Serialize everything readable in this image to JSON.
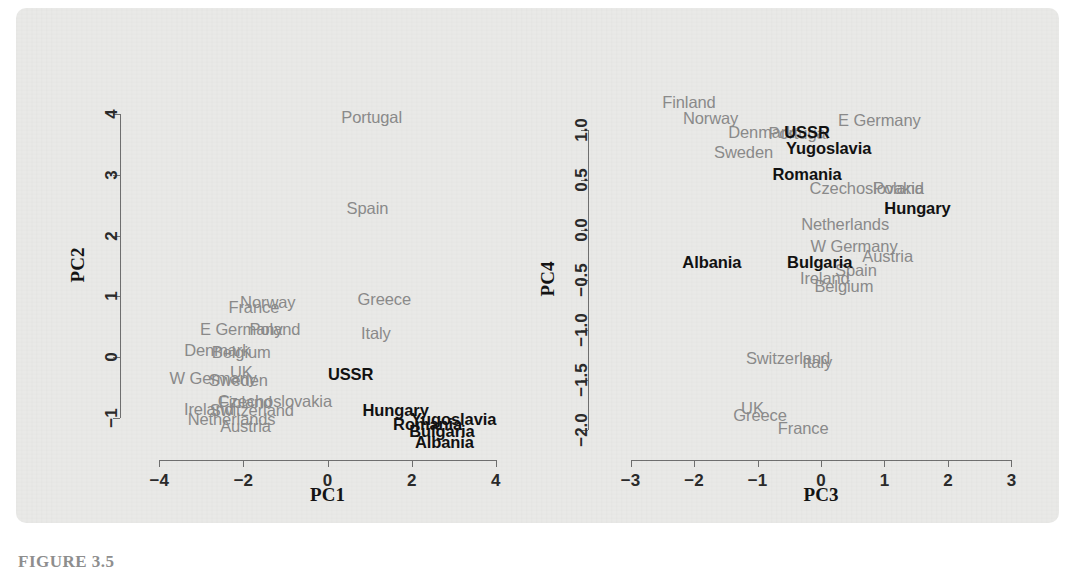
{
  "caption": "FIGURE 3.5",
  "colors": {
    "panel_background": "#e9e9e7",
    "page_background": "#ffffff",
    "axis": "#6f6f6f",
    "western_label": "#8b8b8b",
    "eastern_label": "#121212"
  },
  "chart_data": [
    {
      "type": "scatter",
      "title": "",
      "xlabel": "PC1",
      "ylabel": "PC2",
      "xlim": [
        -4.6,
        4.6
      ],
      "ylim": [
        -1.45,
        4.35
      ],
      "xticks": [
        -4,
        -2,
        0,
        2,
        4
      ],
      "xtick_labels": [
        "−4",
        "−2",
        "0",
        "2",
        "4"
      ],
      "yticks": [
        -1,
        0,
        1,
        2,
        3,
        4
      ],
      "ytick_labels": [
        "−1",
        "0",
        "1",
        "2",
        "3",
        "4"
      ],
      "grid": false,
      "legend": "none",
      "marker": "text-label",
      "series": [
        {
          "name": "Western Europe",
          "color": "#8b8b8b",
          "points": [
            {
              "label": "Portugal",
              "x": 1.05,
              "y": 3.95
            },
            {
              "label": "Spain",
              "x": 0.95,
              "y": 2.45
            },
            {
              "label": "Greece",
              "x": 1.35,
              "y": 0.95
            },
            {
              "label": "France",
              "x": -1.75,
              "y": 0.82
            },
            {
              "label": "Norway",
              "x": -1.42,
              "y": 0.9
            },
            {
              "label": "E Germany",
              "x": -2.05,
              "y": 0.46
            },
            {
              "label": "Poland",
              "x": -1.25,
              "y": 0.46
            },
            {
              "label": "Italy",
              "x": 1.15,
              "y": 0.4
            },
            {
              "label": "Denmark",
              "x": -2.62,
              "y": 0.12
            },
            {
              "label": "Belgium",
              "x": -2.05,
              "y": 0.08
            },
            {
              "label": "UK",
              "x": -2.05,
              "y": -0.24
            },
            {
              "label": "W Germany",
              "x": -2.72,
              "y": -0.34
            },
            {
              "label": "Sweden",
              "x": -2.12,
              "y": -0.38
            },
            {
              "label": "Finland",
              "x": -1.95,
              "y": -0.74
            },
            {
              "label": "Czechoslovakia",
              "x": -1.25,
              "y": -0.72
            },
            {
              "label": "Ireland",
              "x": -2.82,
              "y": -0.86
            },
            {
              "label": "Switzerland",
              "x": -1.8,
              "y": -0.88
            },
            {
              "label": "Netherlands",
              "x": -2.28,
              "y": -1.02
            },
            {
              "label": "Austria",
              "x": -1.95,
              "y": -1.14
            }
          ]
        },
        {
          "name": "Eastern Europe",
          "color": "#121212",
          "points": [
            {
              "label": "USSR",
              "x": 0.55,
              "y": -0.28
            },
            {
              "label": "Hungary",
              "x": 1.62,
              "y": -0.88
            },
            {
              "label": "Yugoslavia",
              "x": 3.0,
              "y": -1.02
            },
            {
              "label": "Romania",
              "x": 2.38,
              "y": -1.1
            },
            {
              "label": "Bulgaria",
              "x": 2.72,
              "y": -1.22
            },
            {
              "label": "Albania",
              "x": 2.78,
              "y": -1.4
            }
          ]
        }
      ]
    },
    {
      "type": "scatter",
      "title": "",
      "xlabel": "PC3",
      "ylabel": "PC4",
      "xlim": [
        -3.45,
        3.45
      ],
      "ylim": [
        -2.15,
        1.35
      ],
      "xticks": [
        -3,
        -2,
        -1,
        0,
        1,
        2,
        3
      ],
      "xtick_labels": [
        "−3",
        "−2",
        "−1",
        "0",
        "1",
        "2",
        "3"
      ],
      "yticks": [
        -2.0,
        -1.5,
        -1.0,
        -0.5,
        0.0,
        0.5,
        1.0
      ],
      "ytick_labels": [
        "−2.0",
        "−1.5",
        "−1.0",
        "−0.5",
        "0.0",
        "0.5",
        "1.0"
      ],
      "grid": false,
      "legend": "none",
      "marker": "text-label",
      "series": [
        {
          "name": "Western Europe",
          "color": "#8b8b8b",
          "points": [
            {
              "label": "Finland",
              "x": -2.08,
              "y": 1.28
            },
            {
              "label": "Norway",
              "x": -1.74,
              "y": 1.12
            },
            {
              "label": "E Germany",
              "x": 0.92,
              "y": 1.1
            },
            {
              "label": "Denmark",
              "x": -0.94,
              "y": 0.98
            },
            {
              "label": "Portugal",
              "x": -0.35,
              "y": 0.97
            },
            {
              "label": "Sweden",
              "x": -1.22,
              "y": 0.78
            },
            {
              "label": "Czechoslovakia",
              "x": 0.72,
              "y": 0.42
            },
            {
              "label": "Poland",
              "x": 1.22,
              "y": 0.42
            },
            {
              "label": "Netherlands",
              "x": 0.38,
              "y": 0.06
            },
            {
              "label": "W Germany",
              "x": 0.52,
              "y": -0.16
            },
            {
              "label": "Austria",
              "x": 1.05,
              "y": -0.26
            },
            {
              "label": "Spain",
              "x": 0.55,
              "y": -0.4
            },
            {
              "label": "Ireland",
              "x": 0.06,
              "y": -0.48
            },
            {
              "label": "Belgium",
              "x": 0.36,
              "y": -0.56
            },
            {
              "label": "Switzerland",
              "x": -0.52,
              "y": -1.28
            },
            {
              "label": "Italy",
              "x": -0.06,
              "y": -1.32
            },
            {
              "label": "UK",
              "x": -1.08,
              "y": -1.78
            },
            {
              "label": "Greece",
              "x": -0.96,
              "y": -1.85
            },
            {
              "label": "France",
              "x": -0.28,
              "y": -1.98
            }
          ]
        },
        {
          "name": "Eastern Europe",
          "color": "#121212",
          "points": [
            {
              "label": "USSR",
              "x": -0.22,
              "y": 0.98
            },
            {
              "label": "Yugoslavia",
              "x": 0.12,
              "y": 0.82
            },
            {
              "label": "Romania",
              "x": -0.22,
              "y": 0.56
            },
            {
              "label": "Hungary",
              "x": 1.52,
              "y": 0.22
            },
            {
              "label": "Albania",
              "x": -1.72,
              "y": -0.32
            },
            {
              "label": "Bulgaria",
              "x": -0.02,
              "y": -0.32
            }
          ]
        }
      ]
    }
  ]
}
